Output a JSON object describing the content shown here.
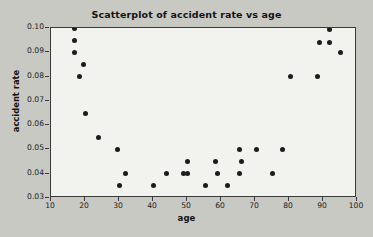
{
  "chart_data": {
    "type": "scatter",
    "title": "Scatterplot of accident rate vs age",
    "xlabel": "age",
    "ylabel": "accident rate",
    "xlim": [
      10,
      100
    ],
    "ylim": [
      0.03,
      0.1
    ],
    "grid": false,
    "legend": null,
    "xticks": [
      10,
      20,
      30,
      40,
      50,
      60,
      70,
      80,
      90,
      100
    ],
    "xtick_labels": [
      "10",
      "20",
      "30",
      "40",
      "50",
      "60",
      "70",
      "80",
      "90",
      "100"
    ],
    "yticks": [
      0.03,
      0.04,
      0.05,
      0.06,
      0.07,
      0.08,
      0.09,
      0.1
    ],
    "ytick_labels": [
      "0.03",
      "0.04",
      "0.05",
      "0.06",
      "0.07",
      "0.08",
      "0.09",
      "0.10"
    ],
    "marker": "filled-circle",
    "marker_color": "#1c1c1c",
    "points": [
      {
        "x": 17,
        "y": 0.1
      },
      {
        "x": 17,
        "y": 0.095
      },
      {
        "x": 17,
        "y": 0.09
      },
      {
        "x": 19.5,
        "y": 0.085
      },
      {
        "x": 18.5,
        "y": 0.08
      },
      {
        "x": 20,
        "y": 0.065
      },
      {
        "x": 24,
        "y": 0.055
      },
      {
        "x": 29.5,
        "y": 0.05
      },
      {
        "x": 32,
        "y": 0.04
      },
      {
        "x": 30,
        "y": 0.035
      },
      {
        "x": 40,
        "y": 0.035
      },
      {
        "x": 44,
        "y": 0.04
      },
      {
        "x": 49,
        "y": 0.04
      },
      {
        "x": 50,
        "y": 0.04
      },
      {
        "x": 50,
        "y": 0.045
      },
      {
        "x": 55.5,
        "y": 0.035
      },
      {
        "x": 58.5,
        "y": 0.045
      },
      {
        "x": 59,
        "y": 0.04
      },
      {
        "x": 62,
        "y": 0.035
      },
      {
        "x": 65.5,
        "y": 0.05
      },
      {
        "x": 66,
        "y": 0.045
      },
      {
        "x": 65.5,
        "y": 0.04
      },
      {
        "x": 70.5,
        "y": 0.05
      },
      {
        "x": 75,
        "y": 0.04
      },
      {
        "x": 78,
        "y": 0.05
      },
      {
        "x": 80.5,
        "y": 0.08
      },
      {
        "x": 88.5,
        "y": 0.08
      },
      {
        "x": 89,
        "y": 0.094
      },
      {
        "x": 92,
        "y": 0.0995
      },
      {
        "x": 92,
        "y": 0.094
      },
      {
        "x": 95,
        "y": 0.09
      }
    ]
  }
}
